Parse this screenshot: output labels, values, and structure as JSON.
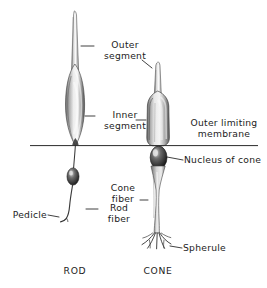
{
  "figure": {
    "background_color": "#ffffff",
    "ink_color": "#1c1c1c",
    "cell_fill_light": "#f2f2f2",
    "cell_fill_mid": "#b4b4b4",
    "cell_fill_dark": "#4a4a4a"
  },
  "labels": {
    "outer_segment": "Outer\nsegment",
    "inner_segment": "Inner\nsegment",
    "outer_limiting_membrane": "Outer limiting\nmembrane",
    "nucleus_of_cone": "Nucleus of cone",
    "rod_fiber": "Rod\nfiber",
    "cone_fiber": "Cone\nfiber",
    "pedicle": "Pedicle",
    "spherule": "Spherule"
  },
  "captions": {
    "rod": "ROD",
    "cone": "CONE"
  },
  "structures": {
    "membrane_line": "outer-limiting-membrane",
    "rod": {
      "outer_segment": "rod-outer-segment",
      "inner_segment": "rod-inner-segment",
      "fiber": "rod-fiber",
      "nucleus": "rod-nucleus",
      "ending": "rod-pedicle"
    },
    "cone": {
      "outer_segment": "cone-outer-segment",
      "inner_segment": "cone-inner-segment",
      "nucleus": "cone-nucleus",
      "fiber": "cone-fiber",
      "ending": "cone-spherule"
    }
  }
}
